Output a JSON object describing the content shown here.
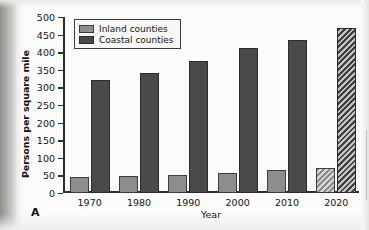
{
  "figure": {
    "panel_label": "A",
    "ylabel": "Persons per square mile",
    "xlabel": "Year"
  },
  "legend": {
    "position": "top-left-inside",
    "items": [
      {
        "label": "Inland counties",
        "color": "#8d8d8d",
        "key": "inland"
      },
      {
        "label": "Coastal counties",
        "color": "#4a4a4a",
        "key": "coastal"
      }
    ]
  },
  "chart_data": {
    "type": "bar",
    "title": "",
    "subtitle": "",
    "xlabel": "Year",
    "ylabel": "Persons per square mile",
    "categories": [
      "1970",
      "1980",
      "1990",
      "2000",
      "2010",
      "2020"
    ],
    "ylim": [
      0,
      500
    ],
    "yticks": [
      0,
      50,
      100,
      150,
      200,
      250,
      300,
      350,
      400,
      450,
      500
    ],
    "ytick_labels": [
      "0",
      "50",
      "100",
      "150",
      "200",
      "250",
      "300",
      "350",
      "400",
      "450",
      "500"
    ],
    "grid": false,
    "legend_position": "upper left",
    "projected_categories": [
      "2020"
    ],
    "projected_style": "diagonal-hatch",
    "series": [
      {
        "name": "Inland counties",
        "color": "#8d8d8d",
        "values": [
          45,
          48,
          52,
          58,
          64,
          70
        ]
      },
      {
        "name": "Coastal counties",
        "color": "#4a4a4a",
        "values": [
          320,
          342,
          376,
          411,
          435,
          470
        ]
      }
    ]
  }
}
